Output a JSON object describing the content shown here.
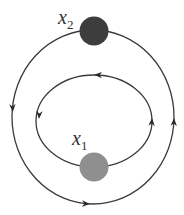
{
  "diagram": {
    "type": "phase-portrait / nested closed orbits",
    "nodes": [
      {
        "id": "x2",
        "label": "x",
        "subscript": "2",
        "color": "#3d3d3d",
        "position": "top of outer orbit"
      },
      {
        "id": "x1",
        "label": "x",
        "subscript": "1",
        "color": "#8f8f8f",
        "position": "bottom of inner orbit"
      }
    ],
    "orbits": [
      {
        "id": "outer",
        "passes_through": "x2",
        "direction": "clockwise",
        "arrow_count": 3,
        "color": "#333333"
      },
      {
        "id": "inner",
        "passes_through": "x1",
        "direction": "counterclockwise",
        "arrow_count": 3,
        "color": "#333333"
      }
    ]
  }
}
